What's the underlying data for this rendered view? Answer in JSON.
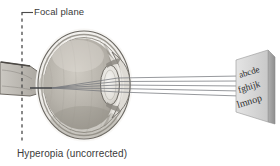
{
  "figure": {
    "type": "anatomical-optics-diagram",
    "caption": "Hyperopia (uncorrected)",
    "focal_plane_label": "Focal plane",
    "eye_chart_lines": [
      "abcde",
      "fghijk",
      "lmnop"
    ],
    "ray_count": 5,
    "colors": {
      "background": "#ffffff",
      "text": "#3a3a3a",
      "ray": "#6f7378",
      "screen_face": "#d8d8d8",
      "screen_edge": "#9a9a9a",
      "sclera": "#f0efec",
      "vitreous": "#b9b5ad",
      "lens": "#e6e4df",
      "cornea": "#dcdad5",
      "outline": "#5a5753",
      "dashed_line": "#4a4a4a"
    },
    "parts": {
      "optic_nerve": "optic-nerve",
      "retina": "retina",
      "lens": "lens",
      "cornea": "cornea",
      "focal_point": "focal-point-behind-retina"
    }
  }
}
